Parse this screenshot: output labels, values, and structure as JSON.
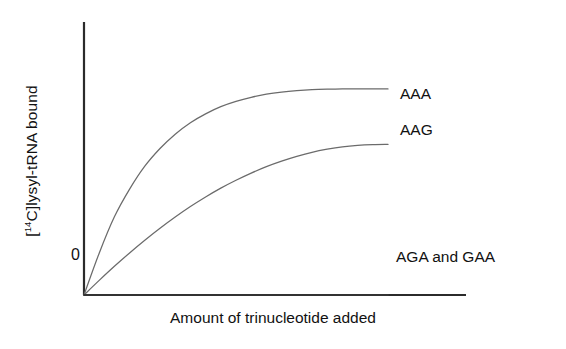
{
  "chart_data": {
    "type": "line",
    "title": "",
    "subtitle": "",
    "xlabel": "Amount of trinucleotide added",
    "ylabel": "[14C]lysyl-tRNA bound",
    "ylabel_prefix": "[",
    "ylabel_superscript": "14",
    "ylabel_suffix": "C]lysyl-tRNA bound",
    "grid": false,
    "legend_position": "end-of-line-annotations",
    "x_tick_labels": [],
    "y_tick_labels": [
      "0"
    ],
    "y_origin_label": "0",
    "xlim": [
      0,
      1
    ],
    "ylim": [
      0,
      1
    ],
    "x": [
      0,
      0.05,
      0.1,
      0.15,
      0.2,
      0.25,
      0.3,
      0.35,
      0.4,
      0.45,
      0.5,
      0.55,
      0.6,
      0.65,
      0.7,
      0.75,
      0.8,
      0.85,
      0.9,
      0.95,
      1.0
    ],
    "series": [
      {
        "name": "AAA",
        "label": "AAA",
        "color": "#6b6b6b",
        "plateau": 0.86,
        "values": [
          0,
          0.175,
          0.327,
          0.443,
          0.539,
          0.613,
          0.673,
          0.721,
          0.758,
          0.788,
          0.81,
          0.827,
          0.84,
          0.849,
          0.855,
          0.859,
          0.861,
          0.862,
          0.862,
          0.862,
          0.862
        ]
      },
      {
        "name": "AAG",
        "label": "AAG",
        "color": "#6b6b6b",
        "plateau": 0.63,
        "values": [
          0,
          0.061,
          0.12,
          0.176,
          0.229,
          0.279,
          0.326,
          0.37,
          0.41,
          0.447,
          0.48,
          0.51,
          0.537,
          0.56,
          0.58,
          0.597,
          0.61,
          0.62,
          0.626,
          0.629,
          0.63
        ]
      },
      {
        "name": "AGA and GAA",
        "label": "AGA and GAA",
        "color": "#333333",
        "plateau": 0.0,
        "values": [
          0,
          0,
          0,
          0,
          0,
          0,
          0,
          0,
          0,
          0,
          0,
          0,
          0,
          0,
          0,
          0,
          0,
          0,
          0,
          0,
          0
        ]
      }
    ]
  },
  "axes": {
    "axis_color": "#2b2b2b",
    "background": "#ffffff"
  }
}
